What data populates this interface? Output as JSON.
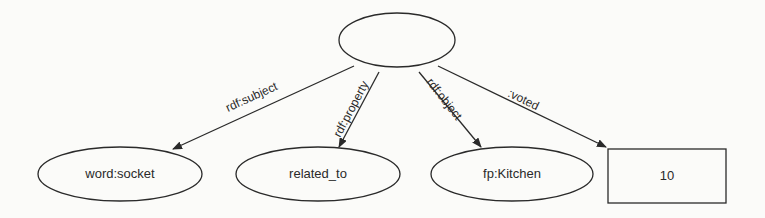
{
  "diagram": {
    "center_node": {
      "label": ""
    },
    "nodes": [
      {
        "id": "subject",
        "label": "word:socket",
        "shape": "ellipse"
      },
      {
        "id": "property",
        "label": "related_to",
        "shape": "ellipse"
      },
      {
        "id": "object",
        "label": "fp:Kitchen",
        "shape": "ellipse"
      },
      {
        "id": "voted",
        "label": "10",
        "shape": "rectangle"
      }
    ],
    "edges": [
      {
        "from": "center",
        "to": "subject",
        "label": "rdf:subject"
      },
      {
        "from": "center",
        "to": "property",
        "label": "rdf:property"
      },
      {
        "from": "center",
        "to": "object",
        "label": "rdf:object"
      },
      {
        "from": "center",
        "to": "voted",
        "label": ":voted"
      }
    ],
    "colors": {
      "stroke": "#2a2a2a",
      "background": "#fbfbf9"
    }
  }
}
